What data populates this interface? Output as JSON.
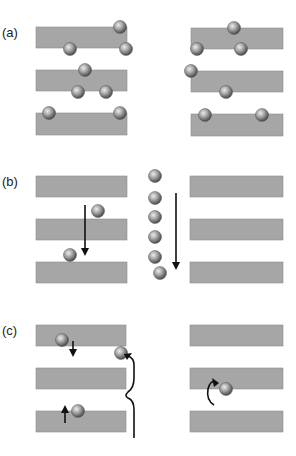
{
  "colors": {
    "bar": "#a6a6a6",
    "bar_edge": "#8c8c8c",
    "sphere_light": "#e8e8e8",
    "sphere_mid": "#9a9a9a",
    "sphere_dark": "#4a4a4a",
    "arrow": "#111111",
    "background": "#ffffff"
  },
  "panels": [
    {
      "label": "(a)",
      "label_pos": [
        2,
        37
      ],
      "bars": [
        {
          "x": 36,
          "y": 27,
          "w": 91,
          "h": 21
        },
        {
          "x": 36,
          "y": 70,
          "w": 91,
          "h": 21
        },
        {
          "x": 36,
          "y": 113,
          "w": 91,
          "h": 22
        },
        {
          "x": 191,
          "y": 28,
          "w": 92,
          "h": 21
        },
        {
          "x": 191,
          "y": 71,
          "w": 92,
          "h": 21
        },
        {
          "x": 191,
          "y": 114,
          "w": 92,
          "h": 22
        }
      ],
      "spheres": [
        [
          120,
          27
        ],
        [
          70,
          49
        ],
        [
          126,
          49
        ],
        [
          85,
          70
        ],
        [
          78,
          92
        ],
        [
          106,
          92
        ],
        [
          49,
          113
        ],
        [
          120,
          113
        ],
        [
          234,
          28
        ],
        [
          197,
          49
        ],
        [
          241,
          49
        ],
        [
          191,
          71
        ],
        [
          226,
          92
        ],
        [
          205,
          115
        ],
        [
          262,
          115
        ]
      ],
      "arrows": []
    },
    {
      "label": "(b)",
      "label_pos": [
        2,
        186
      ],
      "bars": [
        {
          "x": 36,
          "y": 176,
          "w": 91,
          "h": 21
        },
        {
          "x": 36,
          "y": 219,
          "w": 91,
          "h": 21
        },
        {
          "x": 36,
          "y": 262,
          "w": 91,
          "h": 21
        },
        {
          "x": 190,
          "y": 176,
          "w": 93,
          "h": 21
        },
        {
          "x": 190,
          "y": 219,
          "w": 93,
          "h": 21
        },
        {
          "x": 190,
          "y": 262,
          "w": 93,
          "h": 21
        }
      ],
      "spheres": [
        [
          98,
          211
        ],
        [
          70,
          255
        ],
        [
          155,
          176
        ],
        [
          155,
          198
        ],
        [
          155,
          217
        ],
        [
          155,
          237
        ],
        [
          155,
          257
        ],
        [
          160,
          273
        ]
      ],
      "arrows": [
        {
          "name": "diffusion-down-arrow-left",
          "d": "M85 205 L85 250",
          "head": "down",
          "tip": [
            85,
            256
          ]
        },
        {
          "name": "diffusion-down-arrow-column",
          "d": "M176 193 L176 264",
          "head": "down",
          "tip": [
            176,
            270
          ]
        }
      ]
    },
    {
      "label": "(c)",
      "label_pos": [
        2,
        335
      ],
      "bars": [
        {
          "x": 36,
          "y": 325,
          "w": 90,
          "h": 21
        },
        {
          "x": 36,
          "y": 368,
          "w": 90,
          "h": 21
        },
        {
          "x": 36,
          "y": 411,
          "w": 90,
          "h": 21
        },
        {
          "x": 190,
          "y": 325,
          "w": 93,
          "h": 21
        },
        {
          "x": 190,
          "y": 368,
          "w": 93,
          "h": 21
        },
        {
          "x": 190,
          "y": 411,
          "w": 93,
          "h": 21
        }
      ],
      "spheres": [
        [
          62,
          340
        ],
        [
          121,
          353
        ],
        [
          78,
          411
        ],
        [
          226,
          389
        ]
      ],
      "arrows": [
        {
          "name": "hop-down-arrow",
          "d": "M73 341 L73 352",
          "head": "down",
          "tip": [
            73,
            357
          ]
        },
        {
          "name": "hop-up-arrow",
          "d": "M65 423 L65 410",
          "head": "up",
          "tip": [
            65,
            405
          ]
        },
        {
          "name": "long-jump-wavy-arrow",
          "d": "M134 438 L134 410 Q134 400 128 398 Q124 396 128 392 Q134 388 134 378 L134 365 Q134 358 128 356",
          "head": "up-left",
          "tip": [
            124,
            354
          ]
        },
        {
          "name": "rotation-curl-arrow",
          "d": "M214 405 Q206 400 208 389 Q210 380 216 382",
          "head": "right",
          "tip": [
            219,
            383
          ]
        }
      ]
    }
  ]
}
